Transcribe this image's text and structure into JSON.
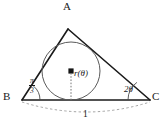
{
  "figure": {
    "type": "geometry-diagram",
    "background_color": "#ffffff",
    "stroke_color": "#1a1a1a",
    "circle_color": "#555555",
    "dash_color": "#888888",
    "vertices": {
      "A": {
        "label": "A",
        "x": 68,
        "y": 29
      },
      "B": {
        "label": "B",
        "x": 22,
        "y": 100
      },
      "C": {
        "label": "C",
        "x": 150,
        "y": 100
      }
    },
    "vertex_labels": [
      {
        "name": "vertex-label-a",
        "text": "A",
        "x": 64,
        "y": 2
      },
      {
        "name": "vertex-label-b",
        "text": "B",
        "x": 3,
        "y": 92
      },
      {
        "name": "vertex-label-c",
        "text": "C",
        "x": 153,
        "y": 92
      }
    ],
    "angles": [
      {
        "at": "B",
        "name": "angle-b",
        "value_numerator": "π",
        "value_denominator": "3",
        "display": "π/3"
      },
      {
        "at": "C",
        "name": "angle-c",
        "display": "2θ"
      }
    ],
    "incircle": {
      "name": "incircle",
      "center_x": 71,
      "center_y": 71,
      "radius": 29,
      "center_dot": true
    },
    "radius_label": {
      "name": "radius-label",
      "text": "r(θ)",
      "x": 74,
      "y": 72
    },
    "base_measure": {
      "name": "base-length-label",
      "text": "1",
      "x": 83,
      "y": 112,
      "arc": "dashed"
    }
  }
}
